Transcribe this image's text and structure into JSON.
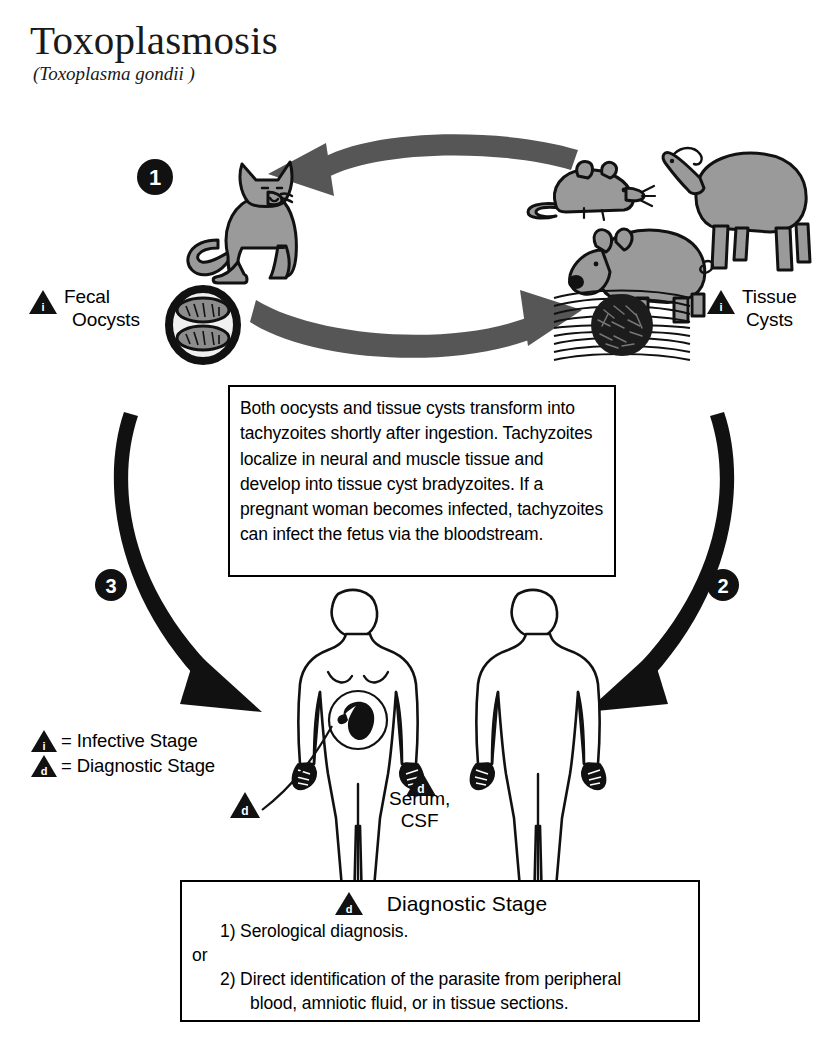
{
  "title": {
    "name": "Toxoplasmosis",
    "scientific_name": "(Toxoplasma gondii )"
  },
  "colors": {
    "animal_fill": "#9a9a9a",
    "animal_outline": "#000000",
    "gray_arrow": "#565656",
    "black": "#000000",
    "background": "#ffffff"
  },
  "cycle_steps": [
    {
      "number": "1",
      "name": "definitive-host-cat"
    },
    {
      "number": "2",
      "name": "tissue-cyst-to-human"
    },
    {
      "number": "3",
      "name": "oocyst-to-human"
    }
  ],
  "labels": {
    "fecal_oocysts_line1": "Fecal",
    "fecal_oocysts_line2": "Oocysts",
    "tissue_cysts_line1": "Tissue",
    "tissue_cysts_line2": "Cysts",
    "serum_line1": "Serum,",
    "serum_line2": "CSF"
  },
  "legend": {
    "infective": {
      "marker": "i",
      "text": "= Infective Stage"
    },
    "diagnostic": {
      "marker": "d",
      "text": "= Diagnostic Stage"
    }
  },
  "info_box": {
    "text": "Both oocysts and tissue cysts transform into tachyzoites shortly after ingestion. Tachyzoites localize in neural and muscle tissue and develop into tissue cyst bradyzoites. If a pregnant woman becomes infected, tachyzoites can infect the fetus via the bloodstream."
  },
  "diagnostic_box": {
    "marker": "d",
    "heading": "Diagnostic Stage",
    "item1": "1) Serological diagnosis.",
    "or": "or",
    "item2a": "2) Direct identification of the parasite from peripheral",
    "item2b": "blood, amniotic fluid, or in tissue sections."
  },
  "organisms": [
    {
      "name": "cat",
      "role": "definitive-host"
    },
    {
      "name": "mouse",
      "role": "intermediate-host"
    },
    {
      "name": "sheep",
      "role": "intermediate-host"
    },
    {
      "name": "pig",
      "role": "intermediate-host"
    },
    {
      "name": "pregnant-woman",
      "role": "human-host"
    },
    {
      "name": "man",
      "role": "human-host"
    }
  ],
  "parasite_forms": [
    {
      "name": "oocyst",
      "label": "Fecal Oocysts",
      "stage": "infective"
    },
    {
      "name": "tissue-cyst",
      "label": "Tissue Cysts",
      "stage": "infective"
    }
  ]
}
